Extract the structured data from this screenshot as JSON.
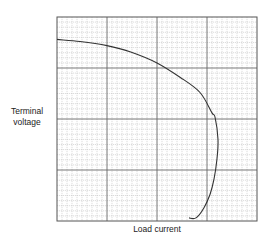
{
  "chart_data": {
    "type": "line",
    "title": "",
    "xlabel": "Load current",
    "ylabel_lines": [
      "Terminal",
      "voltage"
    ],
    "ylabel": "Terminal voltage",
    "grid": true,
    "grid_major_divisions_x": 4,
    "grid_major_divisions_y": 4,
    "grid_minor_per_major": 10,
    "legend": null,
    "axis_ticks": "none",
    "xlim": [
      0,
      4
    ],
    "ylim": [
      0,
      4
    ],
    "series": [
      {
        "name": "Terminal voltage vs load current",
        "x": [
          0.0,
          0.46,
          1.0,
          1.46,
          2.0,
          2.46,
          2.86,
          3.1,
          3.16,
          3.22,
          3.2,
          3.14,
          3.06,
          2.94,
          2.78,
          2.64
        ],
        "y": [
          3.56,
          3.52,
          3.44,
          3.32,
          3.1,
          2.82,
          2.52,
          2.12,
          2.04,
          1.6,
          1.22,
          0.82,
          0.52,
          0.26,
          0.06,
          0.06
        ]
      }
    ],
    "colors": {
      "curve": "#333333",
      "major_grid": "#666666",
      "minor_grid": "#bbbbbb",
      "frame": "#555555"
    }
  }
}
